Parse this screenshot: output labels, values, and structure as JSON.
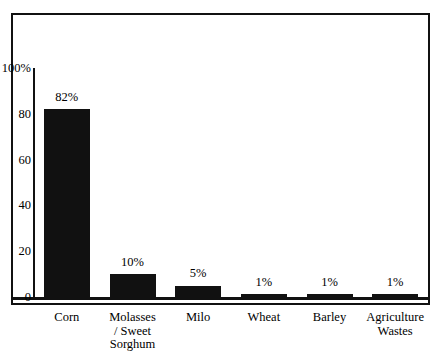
{
  "chart_data": {
    "type": "bar",
    "title": "",
    "subtitle": "",
    "xlabel": "",
    "ylabel": "",
    "categories": [
      "Corn",
      "Molasses\n/ Sweet\nSorghum",
      "Milo",
      "Wheat",
      "Barley",
      "Agriculture\nWastes"
    ],
    "values": [
      82,
      10,
      5,
      1,
      1,
      1
    ],
    "data_labels": [
      "82%",
      "10%",
      "5%",
      "1%",
      "1%",
      "1%"
    ],
    "ylim": [
      0,
      100
    ],
    "ytick_values": [
      0,
      20,
      40,
      60,
      80,
      100
    ],
    "ytick_labels": [
      "0",
      "20",
      "40",
      "60",
      "80",
      "100%"
    ],
    "grid": false,
    "legend": null,
    "bar_color": "#111111",
    "background_color": "#ffffff",
    "frame": true
  },
  "axis": {
    "y_ticks": [
      {
        "label": "100%",
        "value": 100
      },
      {
        "label": "80",
        "value": 80
      },
      {
        "label": "60",
        "value": 60
      },
      {
        "label": "40",
        "value": 40
      },
      {
        "label": "20",
        "value": 20
      },
      {
        "label": "0",
        "value": 0
      }
    ]
  },
  "bars": [
    {
      "label": "Corn",
      "label_lines": "Corn",
      "value": 82,
      "value_label": "82%"
    },
    {
      "label": "Molasses / Sweet Sorghum",
      "label_lines": "Molasses\n/ Sweet\nSorghum",
      "value": 10,
      "value_label": "10%"
    },
    {
      "label": "Milo",
      "label_lines": "Milo",
      "value": 5,
      "value_label": "5%"
    },
    {
      "label": "Wheat",
      "label_lines": "Wheat",
      "value": 1,
      "value_label": "1%"
    },
    {
      "label": "Barley",
      "label_lines": "Barley",
      "value": 1,
      "value_label": "1%"
    },
    {
      "label": "Agriculture Wastes",
      "label_lines": "Agriculture\nWastes",
      "value": 1,
      "value_label": "1%"
    }
  ],
  "colors": {
    "bar": "#111111",
    "frame": "#111111",
    "text": "#000000",
    "background": "#ffffff"
  }
}
